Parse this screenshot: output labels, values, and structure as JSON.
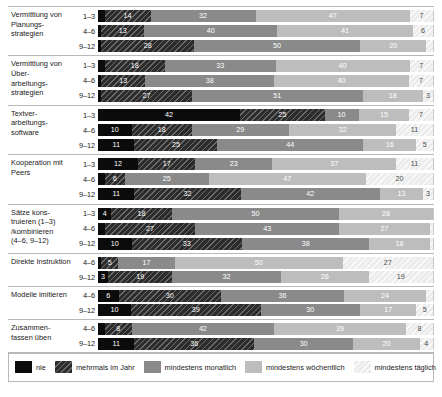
{
  "chart_data": {
    "type": "bar",
    "orientation": "horizontal",
    "stacked": true,
    "stack_unit": "percent",
    "title": "",
    "xlabel": "",
    "ylabel": "",
    "xlim": [
      0,
      100
    ],
    "grid": false,
    "legend_position": "bottom",
    "categories": [
      "nie",
      "mehrmals im Jahr",
      "mindestens monatlich",
      "mindestens wöchentlich",
      "mindestens täglich"
    ],
    "category_colors": [
      "#0b0b0b",
      "#2c2c2c",
      "#8a8a8a",
      "#bdbdbd",
      "#ececec"
    ],
    "groups": [
      {
        "label": "Vermittlung von Planungs-\nstrategien",
        "rows": [
          {
            "grade": "1–3",
            "values": [
              2,
              14,
              32,
              47,
              7
            ]
          },
          {
            "grade": "4–6",
            "values": [
              1,
              13,
              40,
              41,
              6
            ]
          },
          {
            "grade": "9–12",
            "values": [
              1,
              28,
              50,
              20,
              2
            ]
          }
        ]
      },
      {
        "label": "Vermittlung von Über-\narbeitungs-\nstrategien",
        "rows": [
          {
            "grade": "1–3",
            "values": [
              2,
              18,
              33,
              40,
              7
            ]
          },
          {
            "grade": "4–6",
            "values": [
              1,
              13,
              38,
              40,
              7
            ]
          },
          {
            "grade": "9–12",
            "values": [
              1,
              27,
              51,
              18,
              3
            ]
          }
        ]
      },
      {
        "label": "Textver-\narbeitungs-\nsoftware",
        "rows": [
          {
            "grade": "1–3",
            "values": [
              42,
              25,
              10,
              15,
              7
            ]
          },
          {
            "grade": "4–6",
            "values": [
              10,
              18,
              29,
              32,
              11
            ]
          },
          {
            "grade": "9–12",
            "values": [
              11,
              25,
              44,
              16,
              5
            ]
          }
        ]
      },
      {
        "label": "Kooperation mit Peers",
        "rows": [
          {
            "grade": "1–3",
            "values": [
              12,
              17,
              23,
              37,
              11
            ]
          },
          {
            "grade": "4–6",
            "values": [
              2,
              6,
              25,
              47,
              20
            ]
          },
          {
            "grade": "9–12",
            "values": [
              11,
              32,
              42,
              13,
              3
            ]
          }
        ]
      },
      {
        "label": "Sätze kons-\ntruieren (1–3)\n/kombinieren\n(4–6, 9–12)",
        "rows": [
          {
            "grade": "1–3",
            "values": [
              4,
              18,
              50,
              28,
              0
            ]
          },
          {
            "grade": "4–6",
            "values": [
              2,
              27,
              43,
              27,
              1
            ]
          },
          {
            "grade": "9–12",
            "values": [
              10,
              33,
              38,
              18,
              1
            ]
          }
        ]
      },
      {
        "label": "Direkte Instruktion",
        "rows": [
          {
            "grade": "4–6",
            "values": [
              1,
              5,
              17,
              50,
              27
            ]
          },
          {
            "grade": "9–12",
            "values": [
              3,
              19,
              32,
              26,
              19
            ]
          }
        ]
      },
      {
        "label": "Modelle imitieren",
        "rows": [
          {
            "grade": "4–6",
            "values": [
              6,
              30,
              36,
              24,
              2
            ]
          },
          {
            "grade": "9–12",
            "values": [
              10,
              39,
              30,
              17,
              5
            ]
          }
        ]
      },
      {
        "label": "Zusammen-\nfassen üben",
        "rows": [
          {
            "grade": "4–6",
            "values": [
              2,
              8,
              42,
              39,
              8
            ]
          },
          {
            "grade": "9–12",
            "values": [
              11,
              36,
              30,
              20,
              4
            ]
          }
        ]
      }
    ]
  }
}
